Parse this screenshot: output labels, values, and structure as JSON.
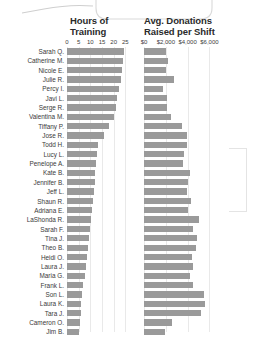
{
  "page": {
    "background": "#ffffff",
    "bar_color": "#9a9a9a",
    "gridline_color": "#e9e9e9",
    "text_color": "#3a3a3a"
  },
  "callout": {
    "name": "rounded-callout-outline",
    "stroke": "#d8d8d8"
  },
  "headers": {
    "column_1": "Hours of\nTraining",
    "column_1_line1": "Hours of",
    "column_1_line2": "Training",
    "column_2": "Avg. Donations\nRaised per Shift",
    "column_2_line1": "Avg. Donations",
    "column_2_line2": "Raised per Shift"
  },
  "axes": {
    "hours": {
      "label": "Hours of Training",
      "ticks": [
        "0",
        "5",
        "10",
        "15",
        "20",
        "25"
      ],
      "tick_values": [
        0,
        5,
        10,
        15,
        20,
        25
      ],
      "min": 0,
      "max": 27
    },
    "donations": {
      "label": "Avg. Donations Raised per Shift",
      "ticks": [
        "$0",
        "$2,000",
        "$4,000",
        "$6,000"
      ],
      "tick_values": [
        0,
        2000,
        4000,
        6000
      ],
      "min": 0,
      "max": 6600
    }
  },
  "chart_data": {
    "type": "bar",
    "orientation": "horizontal",
    "grid": true,
    "legend": "none",
    "categories": [
      "Sarah Q.",
      "Catherine M.",
      "Nicole E.",
      "Julie R.",
      "Percy I.",
      "Javi L.",
      "Serge R.",
      "Valentina M.",
      "Tiffany P.",
      "Jose R.",
      "Todd H.",
      "Lucy  L.",
      "Penelope A.",
      "Kate B.",
      "Jennifer B.",
      "Jeff L.",
      "Shaun R.",
      "Adriana E.",
      "LaShonda R.",
      "Sarah F.",
      "Tina J.",
      "Theo B.",
      "Heidi O.",
      "Laura J.",
      "Maria G.",
      "Frank L.",
      "Son L.",
      "Laura K.",
      "Tara J.",
      "Cameron O.",
      "Jim B.",
      "Rajesh S."
    ],
    "series": [
      {
        "name": "Hours of Training",
        "axis": "hours",
        "xlabel": "Hours of Training",
        "xlim": [
          0,
          27
        ],
        "values": [
          24.5,
          24.0,
          23.4,
          23.0,
          22.2,
          21.6,
          21.0,
          20.2,
          17.8,
          16.0,
          13.4,
          13.0,
          12.6,
          12.2,
          11.8,
          11.4,
          11.0,
          10.8,
          10.4,
          10.0,
          9.6,
          9.2,
          8.6,
          8.0,
          7.6,
          7.0,
          6.6,
          6.2,
          5.8,
          5.4,
          5.0,
          4.2
        ]
      },
      {
        "name": "Avg. Donations Raised per Shift",
        "axis": "donations",
        "xlabel": "Avg. Donations Raised per Shift",
        "xlim": [
          0,
          6600
        ],
        "values": [
          2050,
          2200,
          2000,
          2750,
          1700,
          2100,
          2150,
          2450,
          3450,
          3900,
          3950,
          3700,
          3600,
          4200,
          4050,
          3950,
          4300,
          4000,
          5000,
          4500,
          4900,
          4750,
          4400,
          4500,
          4200,
          4500,
          5500,
          5600,
          5200,
          2600,
          1900,
          2500
        ]
      }
    ]
  },
  "bracket": {
    "name": "selection-bracket"
  }
}
